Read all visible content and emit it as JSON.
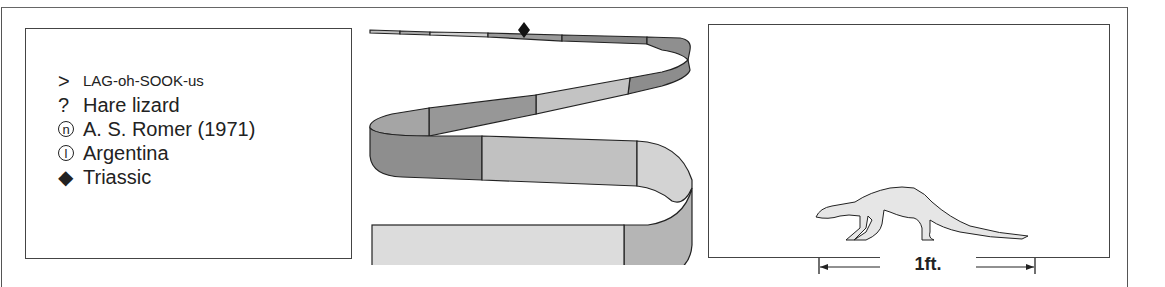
{
  "card": {
    "facts": [
      {
        "icon": "pronunciation-icon",
        "symbol": ">",
        "text": "LAG-oh-SOOK-us"
      },
      {
        "icon": "meaning-icon",
        "symbol": "?",
        "text": "Hare lizard"
      },
      {
        "icon": "named-by-icon",
        "symbol": "n",
        "text": "A. S. Romer (1971)"
      },
      {
        "icon": "location-icon",
        "symbol": "l",
        "text": "Argentina"
      },
      {
        "icon": "period-diamond-icon",
        "symbol": "◆",
        "text": "Triassic"
      }
    ],
    "timeline": {
      "marker": "Triassic",
      "colors": {
        "dark": "#8a8a8a",
        "mid": "#a3a3a3",
        "light": "#cfcfcf",
        "pale": "#dcdcdc",
        "outline": "#222222"
      }
    },
    "scale": {
      "label": "1ft.",
      "animal_fill": "#e6e6e6"
    }
  }
}
